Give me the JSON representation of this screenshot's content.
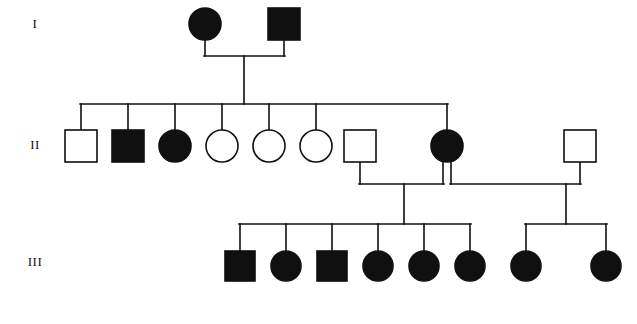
{
  "figure": {
    "kind": "pedigree-chart",
    "title": "",
    "background_color": "#ffffff",
    "line_color": "#101010",
    "affected_fill": "#101010",
    "unaffected_fill": "#ffffff",
    "width": 637,
    "height": 324
  },
  "legend_semantics": {
    "square": "male",
    "circle": "female",
    "filled": "affected",
    "open": "unaffected"
  },
  "generation_labels": [
    {
      "id": "gen-1",
      "text": "I",
      "x": 35,
      "y": 25
    },
    {
      "id": "gen-2",
      "text": "II",
      "x": 35,
      "y": 145
    },
    {
      "id": "gen-3",
      "text": "III",
      "x": 35,
      "y": 262
    }
  ],
  "generations": [
    {
      "id": "I",
      "label": "I",
      "row_y": 24,
      "symbol_size": 32,
      "individuals": [
        {
          "id": "I-1",
          "sex": "female",
          "shape": "circle",
          "status": "affected",
          "filled": true,
          "cx": 205,
          "cy": 24,
          "r": 16
        },
        {
          "id": "I-2",
          "sex": "male",
          "shape": "square",
          "status": "affected",
          "filled": true,
          "cx": 284,
          "cy": 24,
          "size": 32
        }
      ],
      "counts": {
        "total": 2,
        "affected": 2,
        "unaffected": 0,
        "males": 1,
        "females": 1
      }
    },
    {
      "id": "II",
      "label": "II",
      "row_y": 146,
      "symbol_size": 32,
      "individuals": [
        {
          "id": "II-1",
          "sex": "male",
          "shape": "square",
          "status": "unaffected",
          "filled": false,
          "cx": 81,
          "cy": 146,
          "size": 32,
          "role": "child"
        },
        {
          "id": "II-2",
          "sex": "male",
          "shape": "square",
          "status": "affected",
          "filled": true,
          "cx": 128,
          "cy": 146,
          "size": 32,
          "role": "child"
        },
        {
          "id": "II-3",
          "sex": "female",
          "shape": "circle",
          "status": "affected",
          "filled": true,
          "cx": 175,
          "cy": 146,
          "r": 16,
          "role": "child"
        },
        {
          "id": "II-4",
          "sex": "female",
          "shape": "circle",
          "status": "unaffected",
          "filled": false,
          "cx": 222,
          "cy": 146,
          "r": 16,
          "role": "child"
        },
        {
          "id": "II-5",
          "sex": "female",
          "shape": "circle",
          "status": "unaffected",
          "filled": false,
          "cx": 269,
          "cy": 146,
          "r": 16,
          "role": "child"
        },
        {
          "id": "II-6",
          "sex": "female",
          "shape": "circle",
          "status": "unaffected",
          "filled": false,
          "cx": 316,
          "cy": 146,
          "r": 16,
          "role": "child"
        },
        {
          "id": "II-7",
          "sex": "male",
          "shape": "square",
          "status": "unaffected",
          "filled": false,
          "cx": 360,
          "cy": 146,
          "size": 32,
          "role": "spouse"
        },
        {
          "id": "II-8",
          "sex": "female",
          "shape": "circle",
          "status": "affected",
          "filled": true,
          "cx": 447,
          "cy": 146,
          "r": 16,
          "role": "child"
        },
        {
          "id": "II-9",
          "sex": "male",
          "shape": "square",
          "status": "unaffected",
          "filled": false,
          "cx": 580,
          "cy": 146,
          "size": 32,
          "role": "spouse"
        }
      ],
      "counts": {
        "total": 9,
        "affected": 3,
        "unaffected": 6,
        "males": 4,
        "females": 5,
        "children_of_gen_I": 7,
        "married_in": 2
      }
    },
    {
      "id": "III",
      "label": "III",
      "row_y": 266,
      "symbol_size": 30,
      "individuals": [
        {
          "id": "III-1",
          "sex": "male",
          "shape": "square",
          "status": "affected",
          "filled": true,
          "cx": 240,
          "cy": 266,
          "size": 30,
          "sibship": "A"
        },
        {
          "id": "III-2",
          "sex": "female",
          "shape": "circle",
          "status": "affected",
          "filled": true,
          "cx": 286,
          "cy": 266,
          "r": 15,
          "sibship": "A"
        },
        {
          "id": "III-3",
          "sex": "male",
          "shape": "square",
          "status": "affected",
          "filled": true,
          "cx": 332,
          "cy": 266,
          "size": 30,
          "sibship": "A"
        },
        {
          "id": "III-4",
          "sex": "female",
          "shape": "circle",
          "status": "affected",
          "filled": true,
          "cx": 378,
          "cy": 266,
          "r": 15,
          "sibship": "A"
        },
        {
          "id": "III-5",
          "sex": "female",
          "shape": "circle",
          "status": "affected",
          "filled": true,
          "cx": 424,
          "cy": 266,
          "r": 15,
          "sibship": "A"
        },
        {
          "id": "III-6",
          "sex": "female",
          "shape": "circle",
          "status": "affected",
          "filled": true,
          "cx": 470,
          "cy": 266,
          "r": 15,
          "sibship": "A"
        },
        {
          "id": "III-7",
          "sex": "female",
          "shape": "circle",
          "status": "affected",
          "filled": true,
          "cx": 526,
          "cy": 266,
          "r": 15,
          "sibship": "B"
        },
        {
          "id": "III-8",
          "sex": "female",
          "shape": "circle",
          "status": "affected",
          "filled": true,
          "cx": 606,
          "cy": 266,
          "r": 15,
          "sibship": "B"
        }
      ],
      "counts": {
        "total": 8,
        "affected": 8,
        "unaffected": 0,
        "males": 2,
        "females": 6
      }
    }
  ],
  "matings": [
    {
      "id": "mating-1",
      "partners": [
        "I-1",
        "I-2"
      ],
      "mating_line_y": 56,
      "descent_x": 244,
      "sibship_line_y": 104,
      "sibship_span_x": [
        81,
        447
      ],
      "children": [
        "II-1",
        "II-2",
        "II-3",
        "II-4",
        "II-5",
        "II-6",
        "II-8"
      ]
    },
    {
      "id": "mating-2",
      "partners": [
        "II-7",
        "II-8"
      ],
      "mating_line_y": 184,
      "descent_x": 404,
      "sibship_line_y": 224,
      "sibship_span_x": [
        240,
        470
      ],
      "children": [
        "III-1",
        "III-2",
        "III-3",
        "III-4",
        "III-5",
        "III-6"
      ]
    },
    {
      "id": "mating-3",
      "partners": [
        "II-8",
        "II-9"
      ],
      "mating_line_y": 184,
      "descent_x": 566,
      "sibship_line_y": 224,
      "sibship_span_x": [
        526,
        606
      ],
      "children": [
        "III-7",
        "III-8"
      ]
    }
  ],
  "summary": {
    "generations_count": 3,
    "individuals_count": 19,
    "affected_count": 13,
    "unaffected_count": 6
  }
}
